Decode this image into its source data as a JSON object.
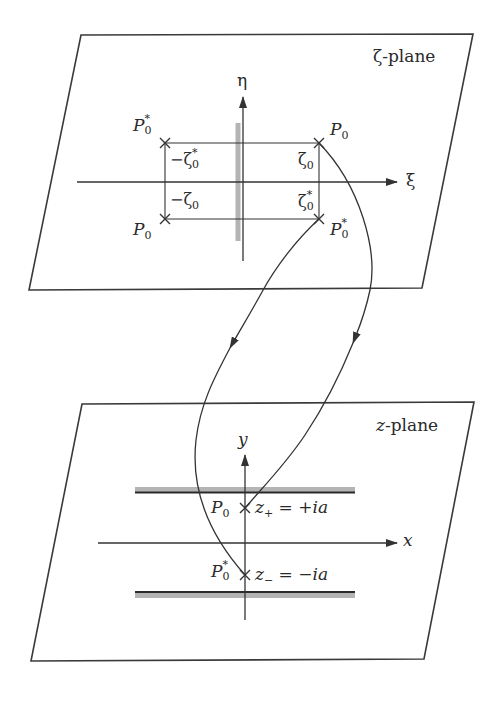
{
  "figure": {
    "type": "conformal-mapping-diagram",
    "colors": {
      "line": "#333333",
      "branch_cut": "#b4b4b4",
      "background": "#ffffff"
    }
  },
  "zeta_plane": {
    "title": "ζ-plane",
    "axes": {
      "horizontal_label": "ξ",
      "vertical_label": "η"
    },
    "points": [
      {
        "name": "P",
        "sub": "0",
        "sup": "*",
        "position": "upper-left"
      },
      {
        "name": "P",
        "sub": "0",
        "sup": "",
        "position": "upper-right"
      },
      {
        "name": "P",
        "sub": "0",
        "sup": "",
        "position": "lower-left"
      },
      {
        "name": "P",
        "sub": "0",
        "sup": "*",
        "position": "lower-right"
      }
    ],
    "values": {
      "upper_left": {
        "prefix": "−ζ",
        "sub": "0",
        "sup": "*"
      },
      "upper_right": {
        "prefix": "ζ",
        "sub": "0",
        "sup": ""
      },
      "lower_left": {
        "prefix": "−ζ",
        "sub": "0",
        "sup": ""
      },
      "lower_right": {
        "prefix": "ζ",
        "sub": "0",
        "sup": "*"
      }
    },
    "branch_cut": "vertical segment along η-axis"
  },
  "z_plane": {
    "title_var": "z",
    "title_rest": "-plane",
    "axes": {
      "horizontal_label": "x",
      "vertical_label": "y"
    },
    "points": [
      {
        "name": "P",
        "sub": "0",
        "sup": "",
        "eq_var": "z",
        "eq_sub": "+",
        "eq_rhs_sign": "= +",
        "eq_rhs_var": "ia"
      },
      {
        "name": "P",
        "sub": "0",
        "sup": "*",
        "eq_var": "z",
        "eq_sub": "−",
        "eq_rhs_sign": "= −",
        "eq_rhs_var": "ia"
      }
    ],
    "strips": "two horizontal boundaries above z+ and below z−"
  },
  "mappings": [
    {
      "from": "ζ-plane P0 (upper-right)",
      "to": "z-plane z+ = +ia"
    },
    {
      "from": "ζ-plane P0* (lower-right)",
      "to": "z-plane z− = −ia"
    }
  ]
}
